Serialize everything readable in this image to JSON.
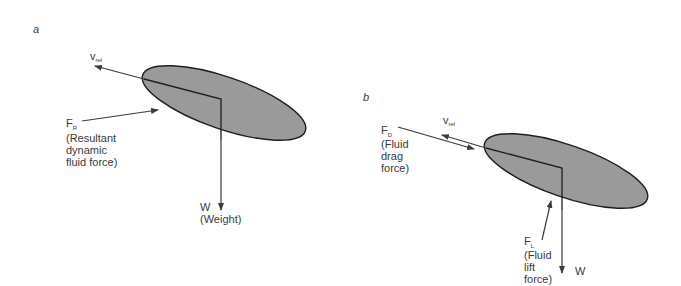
{
  "colors": {
    "body_fill": "#9a9a9a",
    "outline": "#1e1e1e",
    "arrow": "#3c3c3c",
    "text": "#3a3a3a",
    "background": "#ffffff"
  },
  "panels": [
    {
      "id": "a",
      "label": "a",
      "labels": {
        "v_rel_main": "v",
        "v_rel_sub": "rel",
        "f_main": "F",
        "f_sub": "R",
        "f_desc": [
          "(Resultant",
          "dynamic",
          "fluid force)"
        ],
        "w_main": "W",
        "w_desc": "(Weight)"
      }
    },
    {
      "id": "b",
      "label": "b",
      "labels": {
        "v_rel_main": "v",
        "v_rel_sub": "rel",
        "fd_main": "F",
        "fd_sub": "D",
        "fd_desc": [
          "(Fluid",
          "drag",
          "force)"
        ],
        "fl_main": "F",
        "fl_sub": "L",
        "fl_desc": [
          "(Fluid",
          "lift",
          "force)"
        ],
        "w_main": "W"
      }
    }
  ]
}
